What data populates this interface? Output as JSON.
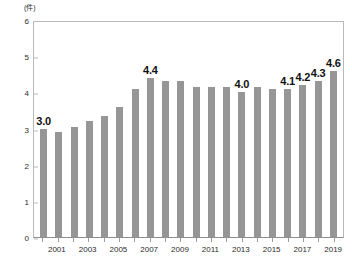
{
  "chart_data": {
    "type": "bar",
    "title": "",
    "subtitle": "",
    "xlabel": "",
    "ylabel": "",
    "unit_label": "(件)",
    "ylim": [
      0,
      6
    ],
    "ytick_step": 1,
    "yticks": [
      "0",
      "1",
      "2",
      "3",
      "4",
      "5",
      "6"
    ],
    "grid": false,
    "legend": false,
    "bar_color": "#969696",
    "categories": [
      "2000",
      "2001",
      "2002",
      "2003",
      "2004",
      "2005",
      "2006",
      "2007",
      "2008",
      "2009",
      "2010",
      "2011",
      "2012",
      "2013",
      "2014",
      "2015",
      "2016",
      "2017",
      "2018",
      "2019"
    ],
    "xtick_labels": [
      "",
      "2001",
      "",
      "2003",
      "",
      "2005",
      "",
      "2007",
      "",
      "2009",
      "",
      "2011",
      "",
      "2013",
      "",
      "2015",
      "",
      "2017",
      "",
      "2019"
    ],
    "values": [
      3.0,
      2.9,
      3.05,
      3.2,
      3.35,
      3.6,
      4.1,
      4.4,
      4.3,
      4.3,
      4.15,
      4.15,
      4.15,
      4.0,
      4.15,
      4.1,
      4.1,
      4.2,
      4.3,
      4.6
    ],
    "point_labels": [
      "3.0",
      "",
      "",
      "",
      "",
      "",
      "",
      "4.4",
      "",
      "",
      "",
      "",
      "",
      "4.0",
      "",
      "",
      "4.1",
      "4.2",
      "4.3",
      "4.6"
    ]
  }
}
